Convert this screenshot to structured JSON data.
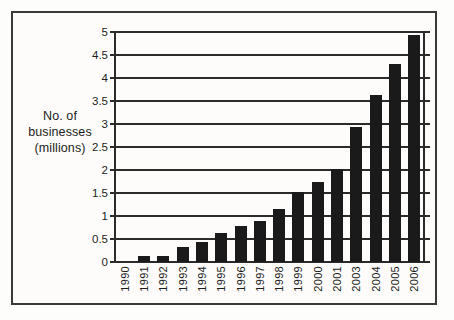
{
  "chart_data": {
    "type": "bar",
    "title": "",
    "subtitle": "",
    "xlabel": "",
    "ylabel": "No. of businesses (millions)",
    "ylabel_lines": [
      "No. of",
      "businesses",
      "(millions)"
    ],
    "categories": [
      "1990",
      "1991",
      "1992",
      "1993",
      "1994",
      "1995",
      "1996",
      "1997",
      "1998",
      "1999",
      "2000",
      "2001",
      "2003",
      "2004",
      "2005",
      "2006"
    ],
    "values": [
      0,
      0.14,
      0.14,
      0.32,
      0.43,
      0.62,
      0.79,
      0.9,
      1.16,
      1.52,
      1.74,
      2.02,
      2.93,
      3.62,
      4.3,
      4.93
    ],
    "ylim": [
      0,
      5
    ],
    "ytick_labels": [
      "0",
      "0.5",
      "1",
      "1.5",
      "2",
      "2.5",
      "3",
      "3.5",
      "4",
      "4.5",
      "5"
    ],
    "ytick_values": [
      0,
      0.5,
      1,
      1.5,
      2,
      2.5,
      3,
      3.5,
      4,
      4.5,
      5
    ],
    "grid": true,
    "legend": false,
    "bar_color": "#1a1a1a",
    "axis_color": "#2b2b2b",
    "background_color": "#fdfcfa",
    "frame_color": "#3a3a3a"
  }
}
